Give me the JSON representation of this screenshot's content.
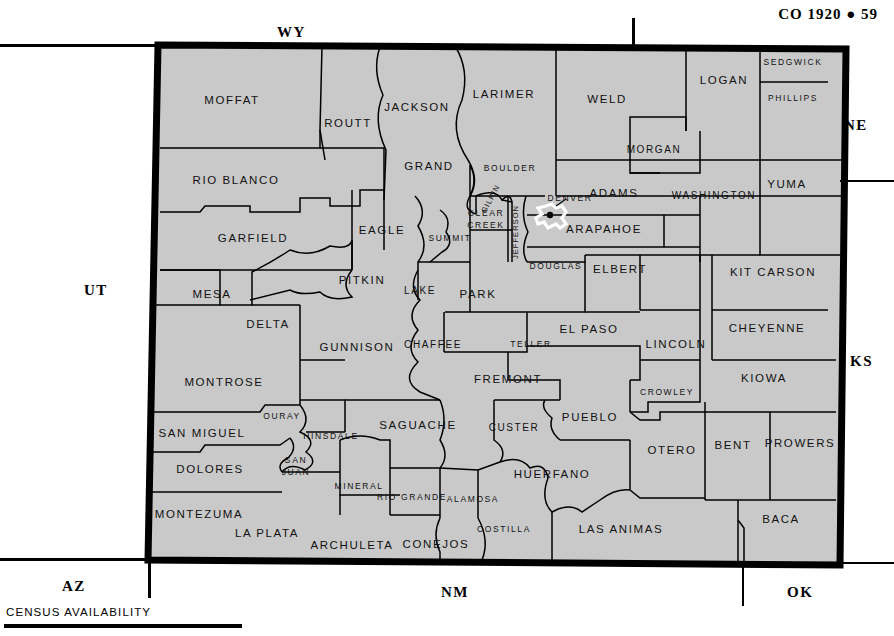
{
  "header": {
    "title": "CO 1920  ●  59"
  },
  "footer": {
    "label": "CENSUS AVAILABILITY"
  },
  "colors": {
    "map_fill": "#c9c9c9",
    "county_line": "#000000",
    "state_border": "#000000",
    "page_background": "#ffffff",
    "denver_outline": "#ffffff"
  },
  "neighbors": [
    {
      "label": "WY",
      "x": 291,
      "y": 33
    },
    {
      "label": "NE",
      "x": 858,
      "y": 126
    },
    {
      "label": "UT",
      "x": 98,
      "y": 291
    },
    {
      "label": "KS",
      "x": 864,
      "y": 362
    },
    {
      "label": "AZ",
      "x": 76,
      "y": 587
    },
    {
      "label": "NM",
      "x": 455,
      "y": 593
    },
    {
      "label": "OK",
      "x": 801,
      "y": 593
    }
  ],
  "city": {
    "name": "DENVER",
    "label_x": 570,
    "label_y": 199
  },
  "counties": [
    {
      "name": "MOFFAT",
      "x": 232,
      "y": 101,
      "size": "s14"
    },
    {
      "name": "ROUTT",
      "x": 348,
      "y": 124,
      "size": "s14"
    },
    {
      "name": "JACKSON",
      "x": 417,
      "y": 108,
      "size": "s14"
    },
    {
      "name": "LARIMER",
      "x": 504,
      "y": 95,
      "size": "s14"
    },
    {
      "name": "WELD",
      "x": 607,
      "y": 100,
      "size": "s14"
    },
    {
      "name": "LOGAN",
      "x": 724,
      "y": 81,
      "size": "s14"
    },
    {
      "name": "SEDGWICK",
      "x": 793,
      "y": 63,
      "size": "s10"
    },
    {
      "name": "PHILLIPS",
      "x": 793,
      "y": 99,
      "size": "s10"
    },
    {
      "name": "MORGAN",
      "x": 654,
      "y": 150,
      "size": "s12"
    },
    {
      "name": "RIO  BLANCO",
      "x": 236,
      "y": 181,
      "size": "s14"
    },
    {
      "name": "GRAND",
      "x": 429,
      "y": 167,
      "size": "s14"
    },
    {
      "name": "BOULDER",
      "x": 510,
      "y": 169,
      "size": "s10"
    },
    {
      "name": "ADAMS",
      "x": 614,
      "y": 194,
      "size": "s14"
    },
    {
      "name": "WASHINGTON",
      "x": 714,
      "y": 196,
      "size": "s12"
    },
    {
      "name": "YUMA",
      "x": 787,
      "y": 185,
      "size": "s14"
    },
    {
      "name": "GARFIELD",
      "x": 253,
      "y": 239,
      "size": "s14"
    },
    {
      "name": "EAGLE",
      "x": 382,
      "y": 231,
      "size": "s14"
    },
    {
      "name": "SUMMIT",
      "x": 450,
      "y": 239,
      "size": "s10"
    },
    {
      "name": "CLEAR",
      "x": 486,
      "y": 214,
      "size": "s10"
    },
    {
      "name": "CREEK",
      "x": 486,
      "y": 226,
      "size": "s10"
    },
    {
      "name": "ARAPAHOE",
      "x": 604,
      "y": 230,
      "size": "s14"
    },
    {
      "name": "MESA",
      "x": 212,
      "y": 295,
      "size": "s14"
    },
    {
      "name": "PITKIN",
      "x": 362,
      "y": 281,
      "size": "s14"
    },
    {
      "name": "LAKE",
      "x": 420,
      "y": 291,
      "size": "s12"
    },
    {
      "name": "PARK",
      "x": 478,
      "y": 295,
      "size": "s14"
    },
    {
      "name": "DOUGLAS",
      "x": 556,
      "y": 267,
      "size": "s10"
    },
    {
      "name": "ELBERT",
      "x": 620,
      "y": 270,
      "size": "s14"
    },
    {
      "name": "KIT  CARSON",
      "x": 773,
      "y": 273,
      "size": "s14"
    },
    {
      "name": "DELTA",
      "x": 268,
      "y": 325,
      "size": "s14"
    },
    {
      "name": "GUNNISON",
      "x": 357,
      "y": 348,
      "size": "s14"
    },
    {
      "name": "CHAFFEE",
      "x": 433,
      "y": 345,
      "size": "s12"
    },
    {
      "name": "TELLER",
      "x": 531,
      "y": 345,
      "size": "s10"
    },
    {
      "name": "EL  PASO",
      "x": 589,
      "y": 330,
      "size": "s14"
    },
    {
      "name": "LINCOLN",
      "x": 676,
      "y": 345,
      "size": "s14"
    },
    {
      "name": "CHEYENNE",
      "x": 767,
      "y": 329,
      "size": "s14"
    },
    {
      "name": "MONTROSE",
      "x": 224,
      "y": 383,
      "size": "s14"
    },
    {
      "name": "FREMONT",
      "x": 508,
      "y": 380,
      "size": "s14"
    },
    {
      "name": "KIOWA",
      "x": 764,
      "y": 379,
      "size": "s14"
    },
    {
      "name": "OURAY",
      "x": 282,
      "y": 417,
      "size": "s10"
    },
    {
      "name": "HINSDALE",
      "x": 331,
      "y": 437,
      "size": "s10"
    },
    {
      "name": "SAGUACHE",
      "x": 418,
      "y": 426,
      "size": "s14"
    },
    {
      "name": "CUSTER",
      "x": 514,
      "y": 428,
      "size": "s12"
    },
    {
      "name": "PUEBLO",
      "x": 590,
      "y": 418,
      "size": "s14"
    },
    {
      "name": "CROWLEY",
      "x": 667,
      "y": 393,
      "size": "s10"
    },
    {
      "name": "SAN  MIGUEL",
      "x": 202,
      "y": 434,
      "size": "s14"
    },
    {
      "name": "DOLORES",
      "x": 210,
      "y": 470,
      "size": "s14"
    },
    {
      "name": "SAN",
      "x": 296,
      "y": 461,
      "size": "s10"
    },
    {
      "name": "JUAN",
      "x": 296,
      "y": 473,
      "size": "s10"
    },
    {
      "name": "MINERAL",
      "x": 359,
      "y": 487,
      "size": "s10"
    },
    {
      "name": "RIO  GRANDE",
      "x": 412,
      "y": 498,
      "size": "s10"
    },
    {
      "name": "ALAMOSA",
      "x": 473,
      "y": 500,
      "size": "s10"
    },
    {
      "name": "HUERFANO",
      "x": 552,
      "y": 475,
      "size": "s14"
    },
    {
      "name": "OTERO",
      "x": 672,
      "y": 451,
      "size": "s14"
    },
    {
      "name": "BENT",
      "x": 733,
      "y": 446,
      "size": "s14"
    },
    {
      "name": "PROWERS",
      "x": 800,
      "y": 444,
      "size": "s14"
    },
    {
      "name": "MONTEZUMA",
      "x": 199,
      "y": 515,
      "size": "s14"
    },
    {
      "name": "LA  PLATA",
      "x": 267,
      "y": 534,
      "size": "s14"
    },
    {
      "name": "ARCHULETA",
      "x": 352,
      "y": 546,
      "size": "s14"
    },
    {
      "name": "CONEJOS",
      "x": 436,
      "y": 545,
      "size": "s14"
    },
    {
      "name": "COSTILLA",
      "x": 504,
      "y": 530,
      "size": "s10"
    },
    {
      "name": "LAS  ANIMAS",
      "x": 621,
      "y": 530,
      "size": "s14"
    },
    {
      "name": "BACA",
      "x": 781,
      "y": 520,
      "size": "s14"
    },
    {
      "name": "GILPIN",
      "x": 0,
      "y": 0,
      "size": "s9",
      "rotate": -62,
      "rx": 491,
      "ry": 199
    },
    {
      "name": "JEFFERSON",
      "x": 0,
      "y": 0,
      "size": "s9",
      "rotate": -90,
      "rx": 516,
      "ry": 232
    }
  ]
}
